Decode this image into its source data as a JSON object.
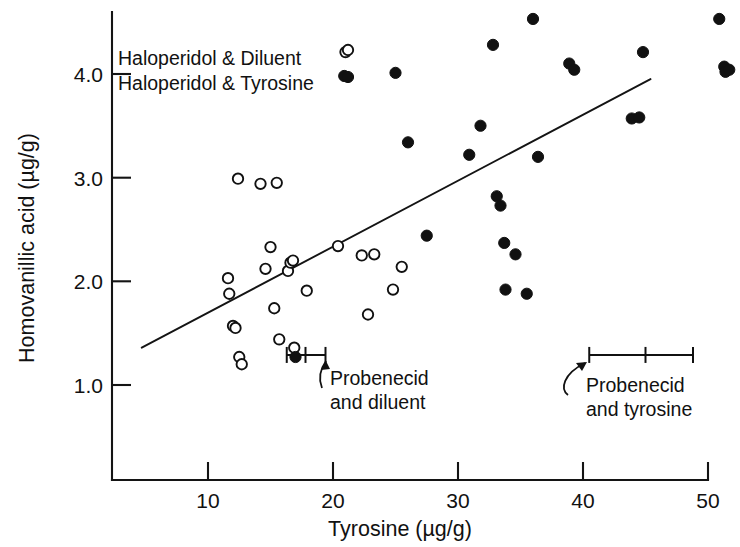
{
  "chart_data": {
    "type": "scatter",
    "title": "",
    "xlabel": "Tyrosine (µg/g)",
    "ylabel": "Homovanillic acid (µg/g)",
    "xlim": [
      3.0,
      53.0
    ],
    "ylim": [
      0.45,
      4.75
    ],
    "xticks": [
      10,
      20,
      30,
      40,
      50
    ],
    "xticklabels": [
      "10",
      "20",
      "30",
      "40",
      "50"
    ],
    "yticks": [
      1.0,
      2.0,
      3.0,
      4.0
    ],
    "yticklabels": [
      "1.0",
      "2.0",
      "3.0",
      "4.0"
    ],
    "grid": false,
    "legend_position": "top-left-inside",
    "marker_color": "#111111",
    "series": [
      {
        "name": "Haloperidol & Diluent",
        "marker": "open-circle",
        "points": [
          [
            11.6,
            2.03
          ],
          [
            11.7,
            1.88
          ],
          [
            12.0,
            1.57
          ],
          [
            12.2,
            1.55
          ],
          [
            12.4,
            2.99
          ],
          [
            12.5,
            1.27
          ],
          [
            12.7,
            1.2
          ],
          [
            14.2,
            2.94
          ],
          [
            14.6,
            2.12
          ],
          [
            15.0,
            2.33
          ],
          [
            15.3,
            1.74
          ],
          [
            15.5,
            2.95
          ],
          [
            15.7,
            1.44
          ],
          [
            16.4,
            2.1
          ],
          [
            16.6,
            2.18
          ],
          [
            16.8,
            2.2
          ],
          [
            16.9,
            1.36
          ],
          [
            17.9,
            1.91
          ],
          [
            20.4,
            2.34
          ],
          [
            21.0,
            4.21
          ],
          [
            22.3,
            2.25
          ],
          [
            22.8,
            1.68
          ],
          [
            23.3,
            2.26
          ],
          [
            24.8,
            1.92
          ],
          [
            25.5,
            2.14
          ]
        ]
      },
      {
        "name": "Haloperidol & Tyrosine",
        "marker": "filled-circle",
        "points": [
          [
            17.0,
            1.27
          ],
          [
            20.9,
            3.98
          ],
          [
            25.0,
            4.01
          ],
          [
            26.0,
            3.34
          ],
          [
            27.5,
            2.44
          ],
          [
            30.9,
            3.22
          ],
          [
            31.8,
            3.5
          ],
          [
            32.8,
            4.28
          ],
          [
            33.1,
            2.82
          ],
          [
            33.4,
            2.73
          ],
          [
            33.7,
            2.37
          ],
          [
            33.8,
            1.92
          ],
          [
            34.6,
            2.26
          ],
          [
            35.5,
            1.88
          ],
          [
            36.0,
            4.53
          ],
          [
            36.4,
            3.2
          ],
          [
            38.9,
            4.1
          ],
          [
            39.3,
            4.04
          ],
          [
            43.9,
            3.57
          ],
          [
            44.5,
            3.58
          ],
          [
            44.8,
            4.21
          ],
          [
            50.9,
            4.53
          ],
          [
            51.3,
            4.07
          ],
          [
            51.4,
            4.02
          ],
          [
            51.7,
            4.04
          ]
        ]
      }
    ],
    "fit_line": {
      "x_start": 4.7,
      "y_start": 1.36,
      "x_end": 45.4,
      "y_end": 3.95
    },
    "error_bars": [
      {
        "label": "Probenecid and diluent",
        "center_x": 17.8,
        "y": 1.29,
        "x_low": 16.3,
        "x_high": 19.4
      },
      {
        "label": "Probenecid and tyrosine",
        "center_x": 45.0,
        "y": 1.29,
        "x_low": 40.5,
        "x_high": 48.8
      }
    ]
  },
  "legend": {
    "entries": [
      {
        "label": "Haloperidol & Diluent",
        "marker": "open-circle"
      },
      {
        "label": "Haloperidol & Tyrosine",
        "marker": "filled-circle"
      }
    ]
  },
  "annotations": [
    {
      "line1": "Probenecid",
      "line2": "and diluent"
    },
    {
      "line1": "Probenecid",
      "line2": "and tyrosine"
    }
  ]
}
